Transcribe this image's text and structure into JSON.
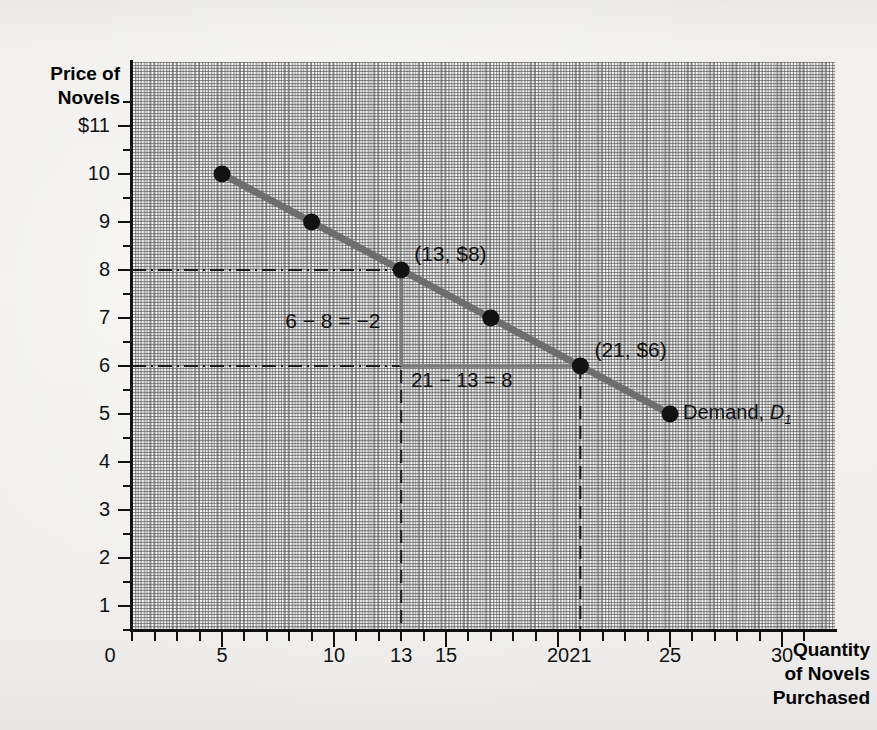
{
  "figure": {
    "y_axis_title_line1": "Price of",
    "y_axis_title_line2": "Novels",
    "x_axis_title_line1": "Quantity",
    "x_axis_title_line2": "of Novels",
    "x_axis_title_line3": "Purchased",
    "origin_label": "0",
    "curve_label_text": "Demand, ",
    "curve_label_symbol": "D",
    "curve_label_subscript": "1",
    "point_label_a": "(13, $8)",
    "point_label_b": "(21, $6)",
    "rise_annotation": "6 − 8 = −2",
    "run_annotation": "21 − 13 = 8",
    "curve_color": "#6e6e6e",
    "point_color": "#111111",
    "guide_color": "#7a7a7a",
    "grid_color": "#6b6b6b",
    "axis_color": "#111111"
  },
  "chart_data": {
    "type": "line",
    "title": "",
    "subtitle": "",
    "xlabel": "Quantity of Novels Purchased",
    "ylabel": "Price of Novels",
    "xlim": [
      0,
      32
    ],
    "ylim": [
      0,
      11.8
    ],
    "grid": true,
    "legend_position": "inline-right",
    "series": [
      {
        "name": "Demand, D1",
        "x": [
          5,
          9,
          13,
          17,
          21,
          25
        ],
        "y": [
          10,
          9,
          8,
          7,
          6,
          5
        ],
        "color": "#6e6e6e",
        "markers": true
      }
    ],
    "x_ticks": [
      0,
      5,
      10,
      13,
      15,
      20,
      21,
      25,
      30
    ],
    "x_tick_labels": [
      "0",
      "5",
      "10",
      "13",
      "15",
      "20",
      "21",
      "25",
      "30"
    ],
    "y_ticks": [
      1,
      2,
      3,
      4,
      5,
      6,
      7,
      8,
      9,
      10,
      11
    ],
    "y_tick_labels": [
      "1",
      "2",
      "3",
      "4",
      "5",
      "6",
      "7",
      "8",
      "9",
      "10",
      "$11"
    ],
    "annotations": [
      {
        "text": "(13, $8)",
        "x": 13,
        "y": 8,
        "role": "point-label"
      },
      {
        "text": "(21, $6)",
        "x": 21,
        "y": 6,
        "role": "point-label"
      },
      {
        "text": "6 − 8 = −2",
        "x": 9.2,
        "y": 7.1,
        "role": "rise"
      },
      {
        "text": "21 − 13 = 8",
        "x": 17,
        "y": 5.75,
        "role": "run"
      },
      {
        "text": "Demand, D1",
        "x": 25.6,
        "y": 5,
        "role": "series-label"
      }
    ],
    "guides": [
      {
        "type": "dashed-horizontal",
        "y": 8,
        "from_x": 0,
        "to_x": 13
      },
      {
        "type": "dashed-horizontal",
        "y": 6,
        "from_x": 0,
        "to_x": 21
      },
      {
        "type": "dashed-vertical",
        "x": 13,
        "from_y": 0,
        "to_y": 8
      },
      {
        "type": "dashed-vertical",
        "x": 21,
        "from_y": 0,
        "to_y": 6
      },
      {
        "type": "solid-vertical-rise",
        "x": 13,
        "from_y": 6,
        "to_y": 8
      },
      {
        "type": "solid-horizontal-run",
        "y": 6,
        "from_x": 13,
        "to_x": 21
      }
    ],
    "slope": -0.25
  }
}
